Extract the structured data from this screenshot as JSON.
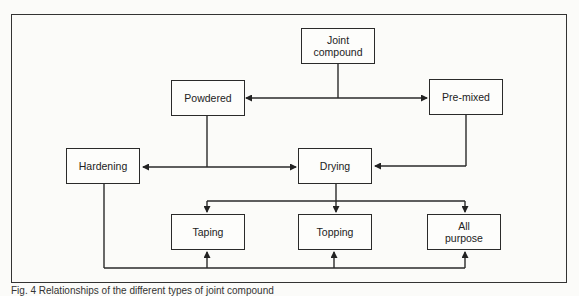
{
  "diagram": {
    "nodes": [
      {
        "id": "joint",
        "label": "Joint compound"
      },
      {
        "id": "powdered",
        "label": "Powdered"
      },
      {
        "id": "premixed",
        "label": "Pre-mixed"
      },
      {
        "id": "hardening",
        "label": "Hardening"
      },
      {
        "id": "drying",
        "label": "Drying"
      },
      {
        "id": "taping",
        "label": "Taping"
      },
      {
        "id": "topping",
        "label": "Topping"
      },
      {
        "id": "allpurpose",
        "label": "All purpose"
      }
    ],
    "edges": [
      {
        "from": "joint",
        "to": "powdered"
      },
      {
        "from": "joint",
        "to": "premixed"
      },
      {
        "from": "powdered",
        "to": "hardening"
      },
      {
        "from": "powdered",
        "to": "drying"
      },
      {
        "from": "premixed",
        "to": "drying"
      },
      {
        "from": "drying",
        "to": "taping"
      },
      {
        "from": "drying",
        "to": "topping"
      },
      {
        "from": "drying",
        "to": "allpurpose"
      },
      {
        "from": "hardening",
        "to": "taping"
      },
      {
        "from": "hardening",
        "to": "topping"
      },
      {
        "from": "hardening",
        "to": "allpurpose"
      }
    ]
  },
  "caption": "Fig. 4 Relationships of the different types of joint compound"
}
